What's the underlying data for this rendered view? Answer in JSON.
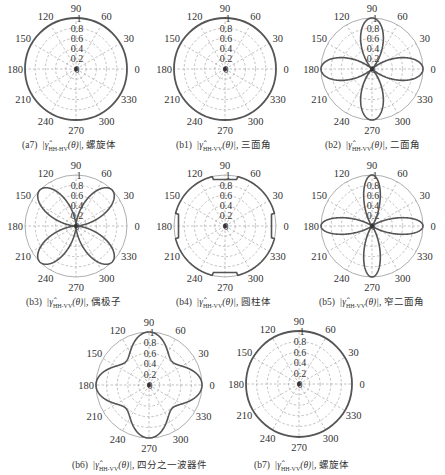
{
  "figure": {
    "angle_ticks": [
      "0",
      "30",
      "60",
      "90",
      "120",
      "150",
      "180",
      "210",
      "240",
      "270",
      "300",
      "330"
    ],
    "radial_ticks": [
      "0",
      "0.2",
      "0.4",
      "0.6",
      "0.8",
      "1"
    ],
    "line_color": "#555555",
    "grid_color": "#a8a8a8"
  },
  "panels": [
    {
      "id": "a7",
      "label": "(a7)",
      "symbol": "|γ̂",
      "subscript": "HH-HV",
      "arg": "(θ)|,",
      "name": "螺旋体"
    },
    {
      "id": "b1",
      "label": "(b1)",
      "symbol": "|γ̂",
      "subscript": "HH-VV",
      "arg": "(θ)|,",
      "name": "三面角"
    },
    {
      "id": "b2",
      "label": "(b2)",
      "symbol": "|γ̂",
      "subscript": "HH-VV",
      "arg": "(θ)|,",
      "name": "二面角"
    },
    {
      "id": "b3",
      "label": "(b3)",
      "symbol": "|γ̂",
      "subscript": "HH-VV",
      "arg": "(θ)|,",
      "name": "偶极子"
    },
    {
      "id": "b4",
      "label": "(b4)",
      "symbol": "|γ̂",
      "subscript": "HH-VV",
      "arg": "(θ)|,",
      "name": "圆柱体"
    },
    {
      "id": "b5",
      "label": "(b5)",
      "symbol": "|γ̂",
      "subscript": "HH-VV",
      "arg": "(θ)|,",
      "name": "窄二面角"
    },
    {
      "id": "b6",
      "label": "(b6)",
      "symbol": "|γ̂",
      "subscript": "HH-VV",
      "arg": "(θ)|,",
      "name": "四分之一波器件"
    },
    {
      "id": "b7",
      "label": "(b7)",
      "symbol": "|γ̂",
      "subscript": "HH-VV",
      "arg": "(θ)|,",
      "name": "螺旋体"
    }
  ],
  "chart_data": [
    {
      "type": "line",
      "polar": true,
      "title": "(a7) |γ̂HH-HV(θ)|, 螺旋体",
      "theta_deg": [
        0,
        30,
        60,
        90,
        120,
        150,
        180,
        210,
        240,
        270,
        300,
        330
      ],
      "r": [
        1,
        1,
        1,
        1,
        1,
        1,
        1,
        1,
        1,
        1,
        1,
        1
      ],
      "rlim": [
        0,
        1
      ],
      "grid": true
    },
    {
      "type": "line",
      "polar": true,
      "title": "(b1) |γ̂HH-VV(θ)|, 三面角",
      "theta_deg": [
        0,
        30,
        60,
        90,
        120,
        150,
        180,
        210,
        240,
        270,
        300,
        330
      ],
      "r": [
        1,
        1,
        1,
        1,
        1,
        1,
        1,
        1,
        1,
        1,
        1,
        1
      ],
      "rlim": [
        0,
        1
      ],
      "grid": true
    },
    {
      "type": "line",
      "polar": true,
      "title": "(b2) |γ̂HH-VV(θ)|, 二面角",
      "theta_deg": [
        0,
        15,
        30,
        45,
        60,
        75,
        90,
        105,
        120,
        135,
        150,
        165,
        180,
        195,
        210,
        225,
        240,
        255,
        270,
        285,
        300,
        315,
        330,
        345
      ],
      "r": [
        1,
        0.8,
        0.4,
        0,
        0.4,
        0.8,
        1,
        0.8,
        0.4,
        0,
        0.4,
        0.8,
        1,
        0.8,
        0.4,
        0,
        0.4,
        0.8,
        1,
        0.8,
        0.4,
        0,
        0.4,
        0.8
      ],
      "shape": "|cos(2θ)|^1.6",
      "rlim": [
        0,
        1
      ],
      "grid": true
    },
    {
      "type": "line",
      "polar": true,
      "title": "(b3) |γ̂HH-VV(θ)|, 偶极子",
      "theta_deg": [
        0,
        15,
        30,
        45,
        60,
        75,
        90,
        105,
        120,
        135,
        150,
        165,
        180,
        195,
        210,
        225,
        240,
        255,
        270,
        285,
        300,
        315,
        330,
        345
      ],
      "r": [
        0,
        0.4,
        0.8,
        1,
        0.8,
        0.4,
        0,
        0.4,
        0.8,
        1,
        0.8,
        0.4,
        0,
        0.4,
        0.8,
        1,
        0.8,
        0.4,
        0,
        0.4,
        0.8,
        1,
        0.8,
        0.4
      ],
      "shape": "|sin(2θ)|^1.6",
      "rlim": [
        0,
        1
      ],
      "grid": true
    },
    {
      "type": "line",
      "polar": true,
      "title": "(b4) |γ̂HH-VV(θ)|, 圆柱体",
      "theta_deg": [
        0,
        45,
        90,
        135,
        180,
        225,
        270,
        315
      ],
      "r": [
        0.97,
        0.9,
        0.97,
        0.9,
        0.97,
        0.9,
        0.97,
        0.9
      ],
      "shape": "rounded square",
      "rlim": [
        0,
        1
      ],
      "grid": true
    },
    {
      "type": "line",
      "polar": true,
      "title": "(b5) |γ̂HH-VV(θ)|, 窄二面角",
      "theta_deg": [
        0,
        15,
        30,
        45,
        60,
        75,
        90,
        105,
        120,
        135,
        150,
        165,
        180,
        195,
        210,
        225,
        240,
        255,
        270,
        285,
        300,
        315,
        330,
        345
      ],
      "r": [
        1,
        0.65,
        0.15,
        0,
        0.15,
        0.65,
        1,
        0.65,
        0.15,
        0,
        0.15,
        0.65,
        1,
        0.65,
        0.15,
        0,
        0.15,
        0.65,
        1,
        0.65,
        0.15,
        0,
        0.15,
        0.65
      ],
      "shape": "|cos(2θ)|^3",
      "rlim": [
        0,
        1
      ],
      "grid": true
    },
    {
      "type": "line",
      "polar": true,
      "title": "(b6) |γ̂HH-VV(θ)|, 四分之一波器件",
      "theta_deg": [
        0,
        15,
        30,
        45,
        60,
        75,
        90,
        105,
        120,
        135,
        150,
        165,
        180,
        195,
        210,
        225,
        240,
        255,
        270,
        285,
        300,
        315,
        330,
        345
      ],
      "r": [
        1,
        0.92,
        0.72,
        0.62,
        0.72,
        0.92,
        1,
        0.92,
        0.72,
        0.62,
        0.72,
        0.92,
        1,
        0.92,
        0.72,
        0.62,
        0.72,
        0.92,
        1,
        0.92,
        0.72,
        0.62,
        0.72,
        0.92
      ],
      "shape": "four-lobed, min ~0.6 at 45°",
      "rlim": [
        0,
        1
      ],
      "grid": true
    },
    {
      "type": "line",
      "polar": true,
      "title": "(b7) |γ̂HH-VV(θ)|, 螺旋体",
      "theta_deg": [
        0,
        30,
        60,
        90,
        120,
        150,
        180,
        210,
        240,
        270,
        300,
        330
      ],
      "r": [
        0,
        0,
        0,
        0,
        0,
        0,
        0,
        0,
        0,
        0,
        0,
        0
      ],
      "rlim": [
        0,
        1
      ],
      "grid": true
    }
  ]
}
